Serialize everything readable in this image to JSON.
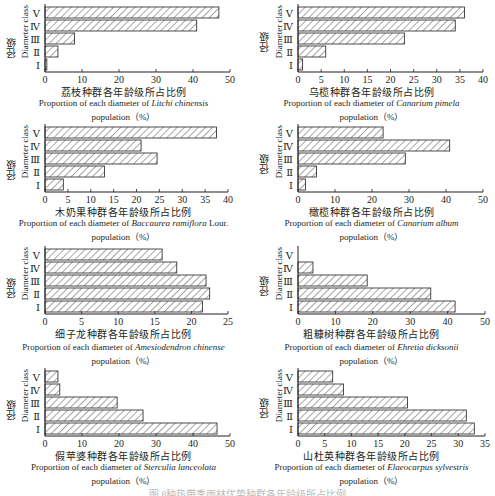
{
  "figure": {
    "caption_partial": "图    8种热带季雨林优势种群各年龄级所占比例"
  },
  "axis_common": {
    "ylabel_cn": "径级",
    "ylabel_en": "Diameter class",
    "categories": [
      "Ⅰ",
      "Ⅱ",
      "Ⅲ",
      "Ⅳ",
      "Ⅴ"
    ]
  },
  "panels": [
    {
      "title_cn": "荔枝种群各年龄级所占比例",
      "title_en_prefix": "Proportion of each diameter of ",
      "species": "Litchi chinensis",
      "title_en_suffix": "",
      "unit_line": "population（%）",
      "xticks": [
        "0",
        "10",
        "20",
        "30",
        "40",
        "50"
      ]
    },
    {
      "title_cn": "乌榄种群各年龄级所占比例",
      "title_en_prefix": "Proportion of each diameter of ",
      "species": "Canarium pimela",
      "title_en_suffix": "",
      "unit_line": "population（%）",
      "xticks": [
        "0",
        "5",
        "10",
        "15",
        "20",
        "25",
        "30",
        "35",
        "40"
      ]
    },
    {
      "title_cn": "木奶果种群各年龄级所占比例",
      "title_en_prefix": "Proportion of each diameter of ",
      "species": "Baccaurea ramiflora",
      "title_en_suffix": " Lour.",
      "unit_line": "population（%）",
      "xticks": [
        "0",
        "5",
        "10",
        "15",
        "20",
        "25",
        "30",
        "35",
        "40"
      ]
    },
    {
      "title_cn": "橄榄种群各年龄级所占比例",
      "title_en_prefix": "Proportion of each diameter of ",
      "species": "Canarium album",
      "title_en_suffix": "",
      "unit_line": "population（%）",
      "xticks": [
        "0",
        "10",
        "20",
        "30",
        "40",
        "50"
      ]
    },
    {
      "title_cn": "细子龙种群各年龄级所占比例",
      "title_en_prefix": "Proportion of each diameter of ",
      "species": "Amesiodendron chinense",
      "title_en_suffix": "",
      "unit_line": "population（%）",
      "xticks": [
        "0",
        "5",
        "10",
        "15",
        "20",
        "25"
      ]
    },
    {
      "title_cn": "粗糠树种群各年龄级所占比例",
      "title_en_prefix": "Proportion of each diameter of ",
      "species": "Ehretia dicksonii",
      "title_en_suffix": "",
      "unit_line": "population（%）",
      "xticks": [
        "0",
        "10",
        "20",
        "30",
        "40",
        "50"
      ]
    },
    {
      "title_cn": "假苹婆种群各年龄级所占比例",
      "title_en_prefix": "Proportion of each diameter of ",
      "species": "Sterculia lanceolata",
      "title_en_suffix": "",
      "unit_line": "population（%）",
      "xticks": [
        "0",
        "10",
        "20",
        "30",
        "40",
        "50"
      ]
    },
    {
      "title_cn": "山杜英种群各年龄级所占比例",
      "title_en_prefix": "Proportion of each diameter of ",
      "species": "Elaeocarpus sylvestris",
      "title_en_suffix": "",
      "unit_line": "population（%）",
      "xticks": [
        "0",
        "5",
        "10",
        "15",
        "20",
        "25",
        "30",
        "35"
      ]
    }
  ],
  "chart_data": [
    {
      "type": "bar",
      "orientation": "horizontal",
      "title": "荔枝种群各年龄级所占比例 / Proportion of each diameter of Litchi chinensis population (%)",
      "categories": [
        "Ⅰ",
        "Ⅱ",
        "Ⅲ",
        "Ⅳ",
        "Ⅴ"
      ],
      "values": [
        0.5,
        3.5,
        8,
        41,
        47
      ],
      "xlabel": "Proportion (%)",
      "ylabel": "径级 Diameter class",
      "xlim": [
        0,
        50
      ],
      "xticks": [
        0,
        10,
        20,
        30,
        40,
        50
      ],
      "grid": false,
      "legend": null,
      "bar_fill": "hatched"
    },
    {
      "type": "bar",
      "orientation": "horizontal",
      "title": "乌榄种群各年龄级所占比例 / Proportion of each diameter of Canarium pimela population (%)",
      "categories": [
        "Ⅰ",
        "Ⅱ",
        "Ⅲ",
        "Ⅳ",
        "Ⅴ"
      ],
      "values": [
        1,
        6,
        23,
        34,
        36
      ],
      "xlabel": "Proportion (%)",
      "ylabel": "径级 Diameter class",
      "xlim": [
        0,
        40
      ],
      "xticks": [
        0,
        5,
        10,
        15,
        20,
        25,
        30,
        35,
        40
      ],
      "grid": false,
      "legend": null,
      "bar_fill": "hatched"
    },
    {
      "type": "bar",
      "orientation": "horizontal",
      "title": "木奶果种群各年龄级所占比例 / Proportion of each diameter of Baccaurea ramiflora Lour. population (%)",
      "categories": [
        "Ⅰ",
        "Ⅱ",
        "Ⅲ",
        "Ⅳ",
        "Ⅴ"
      ],
      "values": [
        4,
        13,
        24.5,
        21,
        37.5
      ],
      "xlabel": "Proportion (%)",
      "ylabel": "径级 Diameter class",
      "xlim": [
        0,
        40
      ],
      "xticks": [
        0,
        5,
        10,
        15,
        20,
        25,
        30,
        35,
        40
      ],
      "grid": false,
      "legend": null,
      "bar_fill": "hatched"
    },
    {
      "type": "bar",
      "orientation": "horizontal",
      "title": "橄榄种群各年龄级所占比例 / Proportion of each diameter of Canarium album population (%)",
      "categories": [
        "Ⅰ",
        "Ⅱ",
        "Ⅲ",
        "Ⅳ",
        "Ⅴ"
      ],
      "values": [
        2,
        5,
        29,
        41,
        23
      ],
      "xlabel": "Proportion (%)",
      "ylabel": "径级 Diameter class",
      "xlim": [
        0,
        50
      ],
      "xticks": [
        0,
        10,
        20,
        30,
        40,
        50
      ],
      "grid": false,
      "legend": null,
      "bar_fill": "hatched"
    },
    {
      "type": "bar",
      "orientation": "horizontal",
      "title": "细子龙种群各年龄级所占比例 / Proportion of each diameter of Amesiodendron chinense population (%)",
      "categories": [
        "Ⅰ",
        "Ⅱ",
        "Ⅲ",
        "Ⅳ",
        "Ⅴ"
      ],
      "values": [
        21.5,
        22.5,
        22,
        18,
        16
      ],
      "xlabel": "Proportion (%)",
      "ylabel": "径级 Diameter class",
      "xlim": [
        0,
        25
      ],
      "xticks": [
        0,
        5,
        10,
        15,
        20,
        25
      ],
      "grid": false,
      "legend": null,
      "bar_fill": "hatched"
    },
    {
      "type": "bar",
      "orientation": "horizontal",
      "title": "粗糠树种群各年龄级所占比例 / Proportion of each diameter of Ehretia dicksonii population (%)",
      "categories": [
        "Ⅰ",
        "Ⅱ",
        "Ⅲ",
        "Ⅳ",
        "Ⅴ"
      ],
      "values": [
        42,
        35.5,
        18.5,
        4,
        0
      ],
      "xlabel": "Proportion (%)",
      "ylabel": "径级 Diameter class",
      "xlim": [
        0,
        50
      ],
      "xticks": [
        0,
        10,
        20,
        30,
        40,
        50
      ],
      "grid": false,
      "legend": null,
      "bar_fill": "hatched"
    },
    {
      "type": "bar",
      "orientation": "horizontal",
      "title": "假苹婆种群各年龄级所占比例 / Proportion of each diameter of Sterculia lanceolata population (%)",
      "categories": [
        "Ⅰ",
        "Ⅱ",
        "Ⅲ",
        "Ⅳ",
        "Ⅴ"
      ],
      "values": [
        46.5,
        26.5,
        19.5,
        4,
        3.5
      ],
      "xlabel": "Proportion (%)",
      "ylabel": "径级 Diameter class",
      "xlim": [
        0,
        50
      ],
      "xticks": [
        0,
        10,
        20,
        30,
        40,
        50
      ],
      "grid": false,
      "legend": null,
      "bar_fill": "hatched"
    },
    {
      "type": "bar",
      "orientation": "horizontal",
      "title": "山杜英种群各年龄级所占比例 / Proportion of each diameter of Elaeocarpus sylvestris population (%)",
      "categories": [
        "Ⅰ",
        "Ⅱ",
        "Ⅲ",
        "Ⅳ",
        "Ⅴ"
      ],
      "values": [
        33,
        31.5,
        20.5,
        8.5,
        6.5
      ],
      "xlabel": "Proportion (%)",
      "ylabel": "径级 Diameter class",
      "xlim": [
        0,
        35
      ],
      "xticks": [
        0,
        5,
        10,
        15,
        20,
        25,
        30,
        35
      ],
      "grid": false,
      "legend": null,
      "bar_fill": "hatched"
    }
  ]
}
